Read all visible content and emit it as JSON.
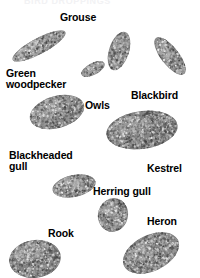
{
  "page": {
    "title_cut_off": "BIRD DROPPINGS",
    "background_color": "#ffffff",
    "text_color": "#000000",
    "dropping_color": "#8e8e8e"
  },
  "labels": [
    {
      "id": "grouse",
      "text": "Grouse",
      "x": 60,
      "y": 12
    },
    {
      "id": "green-woodpecker",
      "text": "Green\nwoodpecker",
      "x": 6,
      "y": 68
    },
    {
      "id": "owls",
      "text": "Owls",
      "x": 85,
      "y": 100
    },
    {
      "id": "blackbird",
      "text": "Blackbird",
      "x": 131,
      "y": 90
    },
    {
      "id": "blackheaded-gull",
      "text": "Blackheaded\ngull",
      "x": 9,
      "y": 150
    },
    {
      "id": "kestrel",
      "text": "Kestrel",
      "x": 147,
      "y": 163
    },
    {
      "id": "herring-gull",
      "text": "Herring gull",
      "x": 93,
      "y": 186
    },
    {
      "id": "rook",
      "text": "Rook",
      "x": 48,
      "y": 228
    },
    {
      "id": "heron",
      "text": "Heron",
      "x": 147,
      "y": 216
    }
  ],
  "droppings": [
    {
      "id": "green-woodpecker-dropping",
      "x": 8,
      "y": 22,
      "w": 62,
      "h": 48,
      "rot": -28,
      "rx": 30,
      "ry": 8,
      "shade": "#9a9a9a"
    },
    {
      "id": "grouse-dropping",
      "x": 104,
      "y": 28,
      "w": 30,
      "h": 46,
      "rot": 18,
      "rx": 10,
      "ry": 20,
      "shade": "#8d8d8d"
    },
    {
      "id": "owls-dropping-small",
      "x": 78,
      "y": 56,
      "w": 30,
      "h": 26,
      "rot": -28,
      "rx": 13,
      "ry": 6,
      "shade": "#9c9c9c"
    },
    {
      "id": "blackbird-dropping",
      "x": 150,
      "y": 30,
      "w": 40,
      "h": 52,
      "rot": -38,
      "rx": 9,
      "ry": 23,
      "shade": "#8f8f8f"
    },
    {
      "id": "blackheaded-gull-dropping",
      "x": 26,
      "y": 92,
      "w": 62,
      "h": 40,
      "rot": -16,
      "rx": 28,
      "ry": 16,
      "shade": "#8b8b8b"
    },
    {
      "id": "owls-dropping-large",
      "x": 104,
      "y": 108,
      "w": 76,
      "h": 44,
      "rot": -8,
      "rx": 36,
      "ry": 19,
      "shade": "#858585"
    },
    {
      "id": "kestrel-dropping",
      "x": 50,
      "y": 172,
      "w": 48,
      "h": 28,
      "rot": -12,
      "rx": 22,
      "ry": 11,
      "shade": "#8d8d8d"
    },
    {
      "id": "herring-gull-dropping",
      "x": 96,
      "y": 196,
      "w": 34,
      "h": 38,
      "rot": 14,
      "rx": 15,
      "ry": 17,
      "shade": "#8a8a8a"
    },
    {
      "id": "rook-dropping",
      "x": 6,
      "y": 238,
      "w": 58,
      "h": 42,
      "rot": -8,
      "rx": 26,
      "ry": 19,
      "shade": "#838383"
    },
    {
      "id": "heron-dropping",
      "x": 118,
      "y": 230,
      "w": 66,
      "h": 46,
      "rot": -26,
      "rx": 30,
      "ry": 18,
      "shade": "#878787"
    }
  ]
}
